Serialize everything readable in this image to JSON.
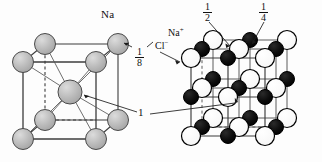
{
  "figure": {
    "background_color": "#fdfdfd",
    "width": 322,
    "height": 162
  },
  "labels": {
    "na": "Na",
    "na_plus": "Na",
    "na_plus_charge": "+",
    "cl_minus": "Cl",
    "cl_minus_charge": "−",
    "one": "1",
    "frac_one_eighth": {
      "numerator": "1",
      "denominator": "8"
    },
    "frac_one_half": {
      "numerator": "1",
      "denominator": "2"
    },
    "frac_one_quarter": {
      "numerator": "1",
      "denominator": "4"
    }
  },
  "colors": {
    "sphere_gray_fill": "#b5b5b5",
    "sphere_gray_highlight": "#d8d8d8",
    "sphere_gray_stroke": "#4a4a4a",
    "sphere_white_fill": "#ffffff",
    "sphere_white_stroke": "#000000",
    "sphere_black_fill": "#0a0a0a",
    "sphere_black_stroke": "#000000",
    "edge_solid": "#3c3c3c",
    "edge_dashed": "#3c3c3c",
    "leader_line": "#1a1a1a",
    "text": "#111111"
  },
  "left_cell": {
    "name": "body-centered-cubic-sodium-cell",
    "element": "Na",
    "sphere_radius_corner": 10.5,
    "sphere_radius_center": 12,
    "corner_atoms": [
      {
        "id": "front-top-left",
        "x": 23,
        "y": 62
      },
      {
        "id": "front-top-right",
        "x": 96,
        "y": 62
      },
      {
        "id": "front-bot-left",
        "x": 23,
        "y": 139
      },
      {
        "id": "front-bot-right",
        "x": 96,
        "y": 139
      },
      {
        "id": "back-top-left",
        "x": 45,
        "y": 44
      },
      {
        "id": "back-top-right",
        "x": 118,
        "y": 44
      },
      {
        "id": "back-bot-left",
        "x": 45,
        "y": 120
      },
      {
        "id": "back-bot-right",
        "x": 118,
        "y": 120
      }
    ],
    "center_atom": {
      "id": "body-center",
      "x": 70,
      "y": 92
    }
  },
  "right_cell": {
    "name": "rock-salt-sodium-chloride-cell",
    "compound": "NaCl",
    "sphere_radius_white": 9.5,
    "sphere_radius_black": 7.5,
    "grid": "3 x 3 x 3 alternating ions",
    "layers": [
      {
        "id": "back-layer",
        "offset_x": 22,
        "offset_y": -18
      },
      {
        "id": "middle-layer",
        "offset_x": 11,
        "offset_y": -9
      },
      {
        "id": "front-layer",
        "offset_x": 0,
        "offset_y": 0
      }
    ],
    "front_origin": {
      "x": 191,
      "y": 58
    },
    "spacing": {
      "x": 37,
      "y": 39
    },
    "ion_pattern_note": "alternating Cl- (white, large) and Na+ (black, small) on a simple cubic lattice"
  },
  "annotations": [
    {
      "id": "leader-na",
      "label": "Na",
      "from": [
        111,
        22
      ],
      "to": [
        121,
        40
      ]
    },
    {
      "id": "leader-one-eighth",
      "label": "1/8",
      "from": [
        133,
        54
      ],
      "to": [
        124,
        46
      ]
    },
    {
      "id": "leader-one",
      "label": "1",
      "from": [
        147,
        112
      ],
      "to": [
        78,
        95
      ]
    },
    {
      "id": "leader-one-right",
      "label": "1",
      "from": [
        150,
        112
      ],
      "to": [
        244,
        100
      ]
    },
    {
      "id": "leader-cl",
      "label": "Cl-",
      "from": [
        168,
        50
      ],
      "to": [
        182,
        60
      ]
    },
    {
      "id": "leader-half",
      "label": "1/2",
      "from": [
        206,
        22
      ],
      "to": [
        231,
        40
      ]
    },
    {
      "id": "leader-quarter",
      "label": "1/4",
      "from": [
        262,
        22
      ],
      "to": [
        250,
        38
      ]
    }
  ]
}
